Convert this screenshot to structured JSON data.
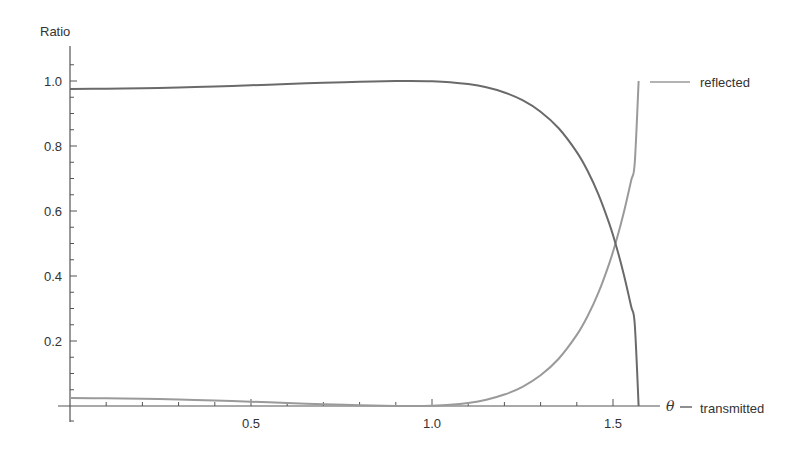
{
  "chart_data": {
    "type": "line",
    "title": "",
    "xlabel": "θ",
    "ylabel": "Ratio",
    "xlim": [
      0,
      1.62
    ],
    "ylim": [
      0,
      1.08
    ],
    "grid": false,
    "legend_position": "right (labels at curve endpoints)",
    "x_ticks": [
      0.5,
      1.0,
      1.5
    ],
    "x_tick_labels": [
      "0.5",
      "1.0",
      "1.5"
    ],
    "y_ticks": [
      0.2,
      0.4,
      0.6,
      0.8,
      1.0
    ],
    "y_tick_labels": [
      "0.2",
      "0.4",
      "0.6",
      "0.8",
      "1.0"
    ],
    "x": [
      0,
      0.1,
      0.2,
      0.3,
      0.4,
      0.5,
      0.6,
      0.7,
      0.8,
      0.9,
      0.94,
      1.0,
      1.05,
      1.1,
      1.15,
      1.2,
      1.25,
      1.3,
      1.35,
      1.4,
      1.43,
      1.46,
      1.49,
      1.51,
      1.53,
      1.55,
      1.56,
      1.5708
    ],
    "series": [
      {
        "name": "reflected",
        "color": "#9a9a9a",
        "values": [
          0.0244,
          0.0238,
          0.0222,
          0.0198,
          0.0167,
          0.0131,
          0.0093,
          0.0055,
          0.0023,
          0.0003,
          0.0,
          0.0009,
          0.0036,
          0.0095,
          0.0194,
          0.0352,
          0.0592,
          0.0945,
          0.1455,
          0.2187,
          0.2768,
          0.3494,
          0.4398,
          0.512,
          0.596,
          0.693,
          0.747,
          1.0
        ]
      },
      {
        "name": "transmitted",
        "color": "#6a6a6a",
        "values": [
          0.9756,
          0.9762,
          0.9778,
          0.9802,
          0.9833,
          0.9869,
          0.9907,
          0.9945,
          0.9977,
          0.9997,
          1.0,
          0.9991,
          0.9964,
          0.9905,
          0.9806,
          0.9648,
          0.9408,
          0.9055,
          0.8545,
          0.7813,
          0.7232,
          0.6506,
          0.5602,
          0.488,
          0.404,
          0.307,
          0.253,
          0.0
        ]
      }
    ]
  },
  "axes": {
    "y_title": "Ratio",
    "x_title": "θ"
  },
  "legend": {
    "reflected": "reflected",
    "transmitted": "transmitted"
  }
}
